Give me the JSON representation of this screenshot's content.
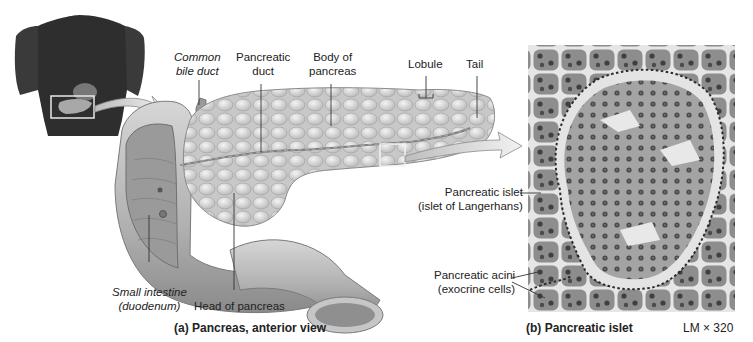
{
  "figure": {
    "panel_a": {
      "caption": "(a) Pancreas, anterior view",
      "labels": {
        "common_bile_duct_line1": "Common",
        "common_bile_duct_line2": "bile duct",
        "pancreatic_duct_line1": "Pancreatic",
        "pancreatic_duct_line2": "duct",
        "body_line1": "Body of",
        "body_line2": "pancreas",
        "lobule": "Lobule",
        "tail": "Tail",
        "small_intestine_line1": "Small intestine",
        "small_intestine_line2": "(duodenum)",
        "head": "Head of pancreas"
      }
    },
    "panel_b": {
      "caption": "(b) Pancreatic islet",
      "magnification": "LM × 320",
      "labels": {
        "islet_line1": "Pancreatic islet",
        "islet_line2": "(islet of Langerhans)",
        "acini_line1": "Pancreatic acini",
        "acini_line2": "(exocrine cells)"
      }
    },
    "colors": {
      "torso": "#2e2e2e",
      "pancreas": "#d9d9d9",
      "duodenum": "#bdbdbd",
      "micrograph_bg": "#8e8e8e",
      "islet_fill": "#a9a9a9",
      "leader": "#333333"
    }
  }
}
